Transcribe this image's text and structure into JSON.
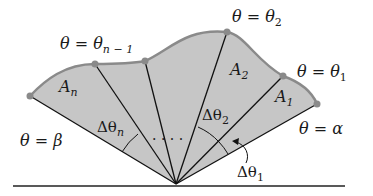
{
  "diagram": {
    "colors": {
      "region_fill": "#c8c8c8",
      "boundary": "#8a8a8a",
      "rays": "#111111",
      "points": "#8a8a8a",
      "text": "#1a1a1a"
    },
    "ray_labels": {
      "beta": {
        "lhs": "θ",
        "eq": " = ",
        "rhs": "β"
      },
      "theta_n_minus_1": {
        "lhs": "θ",
        "eq": " = ",
        "rhs": "θ",
        "sub": "n − 1"
      },
      "theta_2": {
        "lhs": "θ",
        "eq": " = ",
        "rhs": "θ",
        "sub": "2"
      },
      "theta_1": {
        "lhs": "θ",
        "eq": " = ",
        "rhs": "θ",
        "sub": "1"
      },
      "alpha": {
        "lhs": "θ",
        "eq": " = ",
        "rhs": "α"
      }
    },
    "area_labels": [
      {
        "main": "A",
        "sub": "n"
      },
      {
        "main": "A",
        "sub": "2"
      },
      {
        "main": "A",
        "sub": "1"
      }
    ],
    "angle_labels": [
      {
        "main": "Δθ",
        "sub": "n"
      },
      {
        "main": "Δθ",
        "sub": "2"
      },
      {
        "main": "Δθ",
        "sub": "1"
      }
    ],
    "ellipsis": ". . . ."
  }
}
